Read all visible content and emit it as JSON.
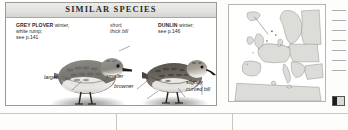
{
  "box": {
    "title": "SIMILAR SPECIES"
  },
  "captions": {
    "grey_plover": {
      "species": "GREY PLOVER",
      "line1_rest": " winter,",
      "line2": "white rump;",
      "line3": "see p.141"
    },
    "bill_note": {
      "line1": "short,",
      "line2": "thick bill"
    },
    "dunlin": {
      "species": "DUNLIN",
      "line1_rest": " winter;",
      "line2": "see p.146"
    }
  },
  "annotations": {
    "larger": "larger",
    "smaller": "smaller",
    "browner": "browner",
    "curved_bill": "slightly curved bill"
  },
  "map": {
    "region": "Europe and Mediterranean distribution map"
  },
  "colors": {
    "header_band": "#e3e3e0",
    "box_border": "#9a9a95",
    "text": "#2a2a2a",
    "map_land": "#d8d8d4",
    "map_sea": "#ffffff"
  }
}
